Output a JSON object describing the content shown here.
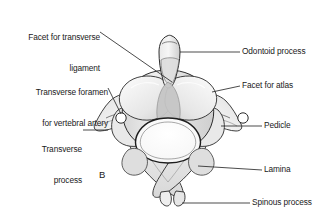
{
  "figure": {
    "panel_letter": "B"
  },
  "labels": {
    "facet_transverse_ligament": {
      "line1": "Facet for transverse",
      "line2": "ligament"
    },
    "transverse_foramen": {
      "line1": "Transverse foramen",
      "line2": "for vertebral artery"
    },
    "transverse_process": {
      "line1": "Transverse",
      "line2": "process"
    },
    "odontoid_process": "Odontoid process",
    "facet_for_atlas": "Facet for atlas",
    "pedicle": "Pedicle",
    "lamina": "Lamina",
    "spinous_process": "Spinous process"
  },
  "colors": {
    "background": "#ffffff",
    "text": "#1a1a1a",
    "outline": "#2b2b2b",
    "bone_light": "#f2f2f2",
    "bone_mid": "#e2e2e2",
    "bone_shadow": "#cccccc",
    "body_grey": "#c6c6c6",
    "foramen_white": "#ffffff",
    "leader_line": "#2b2b2b"
  }
}
